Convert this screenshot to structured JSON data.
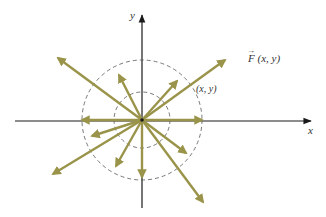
{
  "diagram": {
    "labels": {
      "x_axis": "x",
      "y_axis": "y",
      "field": "F (x, y)",
      "field_arrow": "→",
      "point": "(x, y)"
    },
    "colors": {
      "axes": "#1a1a1a",
      "vectors": "#9a944a",
      "circles": "#555555",
      "text": "#333333"
    },
    "origin": [
      142,
      120
    ],
    "circles": [
      {
        "name": "inner-circle",
        "r": 28
      },
      {
        "name": "outer-circle",
        "r": 60
      }
    ],
    "vectors": [
      {
        "name": "vector-right",
        "tip": [
          202,
          120
        ]
      },
      {
        "name": "vector-left",
        "tip": [
          82,
          120
        ]
      },
      {
        "name": "vector-down",
        "tip": [
          142,
          177
        ]
      },
      {
        "name": "vector-upper-left-long",
        "tip": [
          58,
          58
        ]
      },
      {
        "name": "vector-upper-right-long",
        "tip": [
          225,
          60
        ]
      },
      {
        "name": "vector-lower-left-long",
        "tip": [
          53,
          174
        ]
      },
      {
        "name": "vector-lower-right-long",
        "tip": [
          203,
          202
        ]
      },
      {
        "name": "vector-upper-left-short",
        "tip": [
          119,
          75
        ]
      },
      {
        "name": "vector-upper-right-short",
        "tip": [
          177,
          81
        ]
      },
      {
        "name": "vector-left-down-short",
        "tip": [
          92,
          136
        ]
      },
      {
        "name": "vector-lower-left-short",
        "tip": [
          116,
          166
        ]
      },
      {
        "name": "vector-lower-right-short",
        "tip": [
          186,
          153
        ]
      }
    ]
  }
}
